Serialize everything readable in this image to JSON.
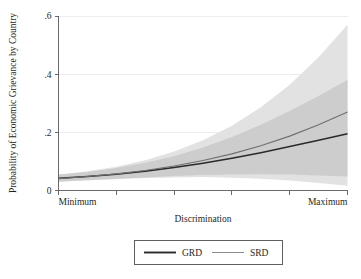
{
  "chart_data": {
    "type": "line",
    "title": "",
    "subtitle": "",
    "xlabel": "Discrimination",
    "ylabel": "Probability of Economic Grievance by Country",
    "xlim": [
      0,
      1
    ],
    "ylim": [
      0,
      0.6
    ],
    "grid": true,
    "grid_axis": "y",
    "legend_position": "bottom-center",
    "x_tick_labels": [
      "Minimum",
      "",
      "",
      "",
      "",
      "Maximum"
    ],
    "x_tick_values": [
      0,
      0.2,
      0.4,
      0.6,
      0.8,
      1.0
    ],
    "y_tick_labels": [
      "0",
      ".2",
      ".4",
      ".6"
    ],
    "y_tick_values": [
      0,
      0.2,
      0.4,
      0.6
    ],
    "x": [
      0,
      0.1,
      0.2,
      0.3,
      0.4,
      0.5,
      0.6,
      0.7,
      0.8,
      0.9,
      1.0
    ],
    "series": [
      {
        "name": "GRD",
        "color": "#2a2a2a",
        "style": "solid-thick",
        "values": [
          0.042,
          0.048,
          0.056,
          0.066,
          0.079,
          0.094,
          0.111,
          0.13,
          0.151,
          0.173,
          0.195
        ],
        "ci_low": [
          0.03,
          0.035,
          0.04,
          0.045,
          0.05,
          0.053,
          0.055,
          0.056,
          0.055,
          0.052,
          0.048
        ],
        "ci_high": [
          0.055,
          0.064,
          0.077,
          0.095,
          0.118,
          0.148,
          0.184,
          0.226,
          0.273,
          0.325,
          0.38
        ],
        "band_color": "#c9c9c9"
      },
      {
        "name": "SRD",
        "color": "#6f6f74",
        "style": "solid-thin",
        "values": [
          0.041,
          0.048,
          0.057,
          0.069,
          0.084,
          0.103,
          0.126,
          0.154,
          0.187,
          0.226,
          0.27
        ],
        "ci_low": [
          0.031,
          0.035,
          0.039,
          0.043,
          0.045,
          0.046,
          0.044,
          0.04,
          0.034,
          0.026,
          0.016
        ],
        "ci_high": [
          0.054,
          0.066,
          0.082,
          0.104,
          0.134,
          0.173,
          0.223,
          0.286,
          0.364,
          0.458,
          0.57
        ],
        "band_color": "#e2e2e2"
      }
    ],
    "legend_entries": [
      {
        "label": "GRD",
        "color": "#2a2a2a",
        "style": "solid-thick"
      },
      {
        "label": "SRD",
        "color": "#6f6f74",
        "style": "solid-thin"
      }
    ],
    "annotations": []
  },
  "axes": {
    "y_label": "Probability of Economic Grievance by Country",
    "x_label": "Discrimination",
    "y_ticks": [
      {
        "label": ".6",
        "value": 0.6
      },
      {
        "label": ".4",
        "value": 0.4
      },
      {
        "label": ".2",
        "value": 0.2
      },
      {
        "label": "0",
        "value": 0
      }
    ],
    "x_ticks": [
      {
        "label": "Minimum",
        "value": 0
      },
      {
        "label": "",
        "value": 0.2
      },
      {
        "label": "",
        "value": 0.4
      },
      {
        "label": "",
        "value": 0.6
      },
      {
        "label": "",
        "value": 0.8
      },
      {
        "label": "Maximum",
        "value": 1.0
      }
    ]
  },
  "legend": {
    "items": [
      {
        "label": "GRD"
      },
      {
        "label": "SRD"
      }
    ]
  },
  "colors": {
    "band_outer": "#e2e2e2",
    "band_inner": "#c9c9c9",
    "line_grd": "#2a2a2a",
    "line_srd": "#6f6f74",
    "axis": "#59595e",
    "grid": "#e9e9ec",
    "background": "#ffffff"
  }
}
